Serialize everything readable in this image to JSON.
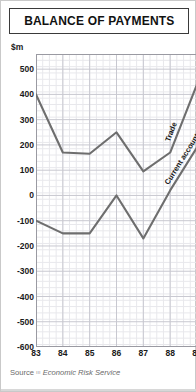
{
  "header": {
    "title": "BALANCE OF PAYMENTS"
  },
  "footer": {
    "source_word": "Source",
    "source_mark": "ııı",
    "source_name": "Economic Risk Service"
  },
  "colors": {
    "line": "#6e6e6e",
    "grid_minor": "#e8e8ec",
    "grid_major": "#c8c8d0",
    "axis": "#9a9aa2",
    "text": "#1a1a1a",
    "border": "#3a3a3a",
    "frame": "#c9c9c9",
    "source_text": "#6a6a6a"
  },
  "chart_data": {
    "type": "line",
    "title": "BALANCE OF PAYMENTS",
    "xlabel": "",
    "ylabel": "$m",
    "unit_label": "$m",
    "grid": true,
    "legend": "inline-labels",
    "x": [
      "83",
      "84",
      "85",
      "86",
      "87",
      "88",
      "89"
    ],
    "categories": [
      "83",
      "84",
      "85",
      "86",
      "87",
      "88",
      "89"
    ],
    "xlim": [
      83,
      89
    ],
    "ylim": [
      -600,
      560
    ],
    "yticks": [
      500,
      400,
      300,
      200,
      100,
      0,
      -100,
      -200,
      -300,
      -400,
      -500,
      -600
    ],
    "ytick_labels": [
      "500",
      "400",
      "300",
      "200",
      "100",
      "0",
      "-100",
      "-200",
      "-300",
      "-400",
      "-500",
      "-600"
    ],
    "series": [
      {
        "name": "Trade",
        "label": "Trade",
        "color": "#6e6e6e",
        "values": [
          400,
          170,
          165,
          250,
          95,
          170,
          440
        ]
      },
      {
        "name": "Current account",
        "label": "Current account",
        "color": "#6e6e6e",
        "values": [
          -100,
          -150,
          -150,
          0,
          -170,
          20,
          190
        ]
      }
    ]
  }
}
